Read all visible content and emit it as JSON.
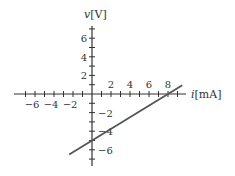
{
  "chart_data": {
    "type": "line",
    "title": "",
    "xlabel_var": "i",
    "xlabel_unit": "[mA]",
    "ylabel_var": "v",
    "ylabel_unit": "[V]",
    "xlim": [
      -7.5,
      10
    ],
    "ylim": [
      -7.5,
      7.5
    ],
    "x_ticks": [
      -6,
      -4,
      -2,
      2,
      4,
      6,
      8
    ],
    "y_ticks": [
      -6,
      -2,
      2,
      4,
      6
    ],
    "y_tick_hidden_label": [
      -4
    ],
    "minor_tick_step": 1,
    "grid": false,
    "legend": null,
    "series": [
      {
        "name": "v-i line",
        "equation": "v = 0.625*i - 5",
        "points": [
          {
            "i": -2.4,
            "v": -6.5
          },
          {
            "i": 0,
            "v": -5
          },
          {
            "i": 8,
            "v": 0
          },
          {
            "i": 9.5,
            "v": 0.94
          }
        ],
        "color": "#555555"
      }
    ]
  },
  "axes": {
    "x_label": "i[mA]",
    "y_label": "v[V]"
  },
  "colors": {
    "axis": "#333333",
    "line": "#555555",
    "background": "#ffffff"
  }
}
